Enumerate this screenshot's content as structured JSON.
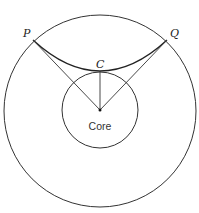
{
  "diagram": {
    "labels": {
      "P": "P",
      "Q": "Q",
      "C": "C",
      "core": "Core"
    },
    "elements": {
      "outer_circle": {
        "cx": 100,
        "cy": 111,
        "r": 96
      },
      "core_circle": {
        "cx": 100,
        "cy": 110,
        "r": 38
      },
      "point_P": {
        "x": 33,
        "y": 40
      },
      "point_Q": {
        "x": 167,
        "y": 40
      },
      "point_C": {
        "x": 100,
        "y": 71
      },
      "center": {
        "x": 100,
        "y": 110
      }
    },
    "colors": {
      "stroke": "#333333",
      "background": "#ffffff"
    }
  }
}
